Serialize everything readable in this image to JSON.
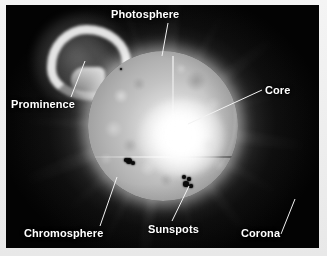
{
  "diagram": {
    "subject": "sun",
    "background_color": "#030303",
    "frame_color": "#f0f0f0",
    "label_color": "#ffffff",
    "leader_color": "#f2f2f2",
    "labels": [
      {
        "id": "photosphere",
        "text": "Photosphere",
        "x": 111,
        "y": 8,
        "leader": {
          "x1": 168,
          "y1": 23,
          "x2": 162,
          "y2": 56
        }
      },
      {
        "id": "core",
        "text": "Core",
        "x": 265,
        "y": 84,
        "leader": {
          "x1": 262,
          "y1": 90,
          "x2": 188,
          "y2": 124
        }
      },
      {
        "id": "prominence",
        "text": "Prominence",
        "x": 11,
        "y": 98,
        "leader": {
          "x1": 71,
          "y1": 97,
          "x2": 85,
          "y2": 61
        }
      },
      {
        "id": "chromosphere",
        "text": "Chromosphere",
        "x": 24,
        "y": 227,
        "leader": {
          "x1": 100,
          "y1": 226,
          "x2": 117,
          "y2": 177
        }
      },
      {
        "id": "sunspots",
        "text": "Sunspots",
        "x": 148,
        "y": 223,
        "leader": {
          "x1": 172,
          "y1": 221,
          "x2": 189,
          "y2": 186
        }
      },
      {
        "id": "corona",
        "text": "Corona",
        "x": 241,
        "y": 227,
        "leader": {
          "x1": 281,
          "y1": 234,
          "x2": 295,
          "y2": 199
        }
      }
    ],
    "sun": {
      "disc_center": {
        "x": 157,
        "y": 121
      },
      "disc_radius": 75,
      "core_highlight": {
        "x": 178,
        "y": 124
      },
      "sunspots": [
        {
          "x": 129,
          "y": 161,
          "r": 3.0
        },
        {
          "x": 133,
          "y": 163,
          "r": 2.2
        },
        {
          "x": 126,
          "y": 160,
          "r": 1.8
        },
        {
          "x": 184,
          "y": 177,
          "r": 2.0
        },
        {
          "x": 189,
          "y": 179,
          "r": 1.6
        },
        {
          "x": 186,
          "y": 184,
          "r": 2.8
        },
        {
          "x": 191,
          "y": 186,
          "r": 1.6
        },
        {
          "x": 121,
          "y": 69,
          "r": 1.2
        }
      ],
      "corona_rays": [
        {
          "angle": 8,
          "length": 148,
          "width": 10,
          "opacity": 0.5
        },
        {
          "angle": 26,
          "length": 132,
          "width": 6,
          "opacity": 0.38
        },
        {
          "angle": 48,
          "length": 126,
          "width": 8,
          "opacity": 0.34
        },
        {
          "angle": 68,
          "length": 150,
          "width": 12,
          "opacity": 0.46
        },
        {
          "angle": 92,
          "length": 140,
          "width": 7,
          "opacity": 0.36
        },
        {
          "angle": 116,
          "length": 128,
          "width": 9,
          "opacity": 0.32
        },
        {
          "angle": 140,
          "length": 146,
          "width": 11,
          "opacity": 0.42
        },
        {
          "angle": 163,
          "length": 134,
          "width": 6,
          "opacity": 0.34
        },
        {
          "angle": 186,
          "length": 150,
          "width": 12,
          "opacity": 0.48
        },
        {
          "angle": 208,
          "length": 130,
          "width": 7,
          "opacity": 0.33
        },
        {
          "angle": 232,
          "length": 142,
          "width": 10,
          "opacity": 0.4
        },
        {
          "angle": 255,
          "length": 126,
          "width": 6,
          "opacity": 0.3
        },
        {
          "angle": 278,
          "length": 148,
          "width": 11,
          "opacity": 0.44
        },
        {
          "angle": 300,
          "length": 134,
          "width": 8,
          "opacity": 0.34
        },
        {
          "angle": 322,
          "length": 140,
          "width": 9,
          "opacity": 0.38
        },
        {
          "angle": 344,
          "length": 128,
          "width": 6,
          "opacity": 0.3
        }
      ]
    }
  }
}
